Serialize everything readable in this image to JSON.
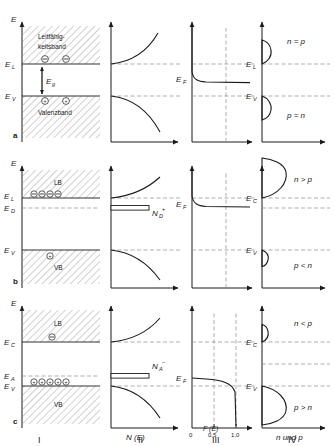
{
  "figure": {
    "columns": [
      {
        "numeral": "I",
        "axis_x": "",
        "axis_y": "E"
      },
      {
        "numeral": "II",
        "axis_x": "N (E)",
        "axis_y": "E"
      },
      {
        "numeral": "III",
        "axis_x": "F (E)",
        "axis_y": "E"
      },
      {
        "numeral": "IV",
        "axis_x": "n und p",
        "axis_y": "E"
      }
    ],
    "fermi_axis_ticks": [
      "0",
      "0,5",
      "1,0"
    ],
    "energy_axis_label": "E"
  },
  "rows": [
    {
      "letter": "a",
      "type": "intrinsic",
      "band_upper_label": "Leitfähig-",
      "band_upper_label2": "keitsband",
      "band_lower_label": "Valenzband",
      "level_upper": "E",
      "level_upper_sub": "L",
      "level_lower": "E",
      "level_lower_sub": "V",
      "gap_label": "E",
      "gap_sub": "g",
      "fermi_label": "E",
      "fermi_sub": "F",
      "dos_level_label": "",
      "carrier_top": "n = p",
      "carrier_bottom": "p = n",
      "col4_upper": "E",
      "col4_upper_sub": "L",
      "col4_lower": "E",
      "col4_lower_sub": "V"
    },
    {
      "letter": "b",
      "type": "n-type",
      "band_upper_label": "LB",
      "band_upper_label2": "",
      "band_lower_label": "VB",
      "level_upper": "E",
      "level_upper_sub": "L",
      "level_lower": "E",
      "level_lower_sub": "V",
      "dopant_level": "E",
      "dopant_sub": "D",
      "gap_label": "",
      "gap_sub": "",
      "fermi_label": "E",
      "fermi_sub": "F",
      "dos_level_label": "N",
      "dos_level_sub": "D",
      "dos_level_sup": "+",
      "carrier_top": "n > p",
      "carrier_bottom": "p < n",
      "col4_upper": "E",
      "col4_upper_sub": "C",
      "col4_lower": "E",
      "col4_lower_sub": "V"
    },
    {
      "letter": "c",
      "type": "p-type",
      "band_upper_label": "LB",
      "band_upper_label2": "",
      "band_lower_label": "VB",
      "level_upper": "E",
      "level_upper_sub": "C",
      "level_lower": "E",
      "level_lower_sub": "V",
      "dopant_level": "E",
      "dopant_sub": "A",
      "gap_label": "",
      "gap_sub": "",
      "fermi_label": "E",
      "fermi_sub": "F",
      "dos_level_label": "N",
      "dos_level_sub": "A",
      "dos_level_sup": "−",
      "carrier_top": "n < p",
      "carrier_bottom": "p > n",
      "col4_upper": "E",
      "col4_upper_sub": "C",
      "col4_lower": "E",
      "col4_lower_sub": "V"
    }
  ],
  "colors": {
    "ink": "#1a1a1a",
    "dashed": "#8c8c8c",
    "hatch": "#8c8c8c",
    "background": "#ffffff"
  }
}
